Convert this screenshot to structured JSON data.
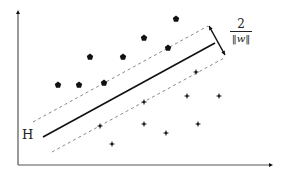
{
  "diagram": {
    "type": "svm-maximum-margin-hyperplane",
    "hyperplane_label": "H",
    "margin_label": {
      "numerator": "2",
      "denominator": "‖w‖"
    },
    "colors": {
      "axis": "#555555",
      "hyperplane": "#111111",
      "margin_lines": "#888888",
      "points": "#111111"
    },
    "axes": {
      "origin": [
        18,
        165
      ],
      "y_top": [
        18,
        10
      ],
      "x_right": [
        273,
        165
      ]
    },
    "hyperplane": {
      "x1": 43,
      "y1": 137,
      "x2": 215,
      "y2": 43
    },
    "margin_upper": {
      "x1": 33,
      "y1": 122,
      "x2": 208,
      "y2": 26
    },
    "margin_lower": {
      "x1": 52,
      "y1": 152,
      "x2": 226,
      "y2": 57
    },
    "margin_arrow": {
      "x1": 209,
      "y1": 26,
      "x2": 225,
      "y2": 55
    },
    "class_a_points": [
      [
        58,
        85
      ],
      [
        79,
        85
      ],
      [
        104,
        83
      ],
      [
        90,
        57
      ],
      [
        123,
        57
      ],
      [
        144,
        38
      ],
      [
        168,
        48
      ],
      [
        176,
        19
      ]
    ],
    "class_b_points": [
      [
        196,
        72
      ],
      [
        187,
        96
      ],
      [
        219,
        96
      ],
      [
        144,
        102
      ],
      [
        100,
        126
      ],
      [
        144,
        124
      ],
      [
        198,
        124
      ],
      [
        166,
        133
      ],
      [
        112,
        144
      ]
    ]
  }
}
